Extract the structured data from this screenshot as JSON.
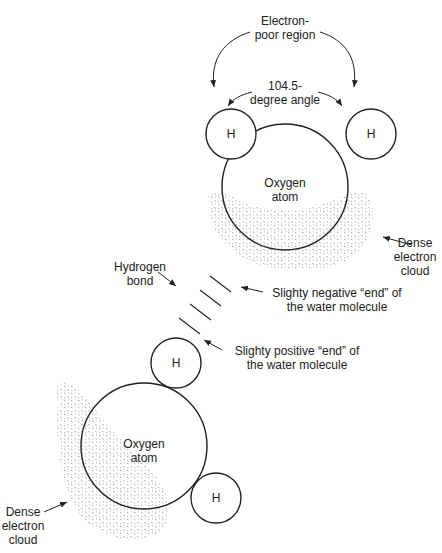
{
  "diagram": {
    "top_molecule": {
      "electron_poor_label": [
        "Electron-",
        "poor region"
      ],
      "angle_label": [
        "104.5-",
        "degree angle"
      ],
      "hydrogen_left": "H",
      "hydrogen_right": "H",
      "oxygen_label": [
        "Oxygen",
        "atom"
      ],
      "cloud_label": [
        "Dense",
        "electron",
        "cloud"
      ]
    },
    "hydrogen_bond_label": [
      "Hydrogen",
      "bond"
    ],
    "negative_end_label": [
      "Slighty negative “end” of",
      "the water molecule"
    ],
    "positive_end_label": [
      "Slighty positive “end” of",
      "the water molecule"
    ],
    "bottom_molecule": {
      "hydrogen_top": "H",
      "hydrogen_bottom": "H",
      "oxygen_label": [
        "Oxygen",
        "atom"
      ],
      "cloud_label": [
        "Dense",
        "electron",
        "cloud"
      ]
    },
    "colors": {
      "stroke": "#222222",
      "stipple": "#777777",
      "background": "#ffffff"
    }
  }
}
